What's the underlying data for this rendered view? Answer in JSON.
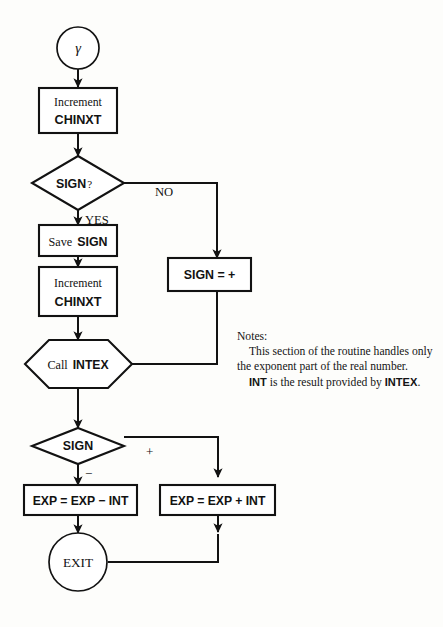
{
  "diagram": {
    "colors": {
      "ink": "#121212",
      "paper": "#fdfdfb",
      "shape_fill": "#ffffff"
    },
    "nodes": {
      "entry": {
        "label": "γ",
        "shape": "circle"
      },
      "increment_1": {
        "line1": "Increment",
        "line2": "CHINXT",
        "shape": "process"
      },
      "sign_question": {
        "label": "SIGN",
        "suffix": "?",
        "shape": "decision"
      },
      "save_sign": {
        "label_a": "Save",
        "label_b": "SIGN",
        "shape": "process"
      },
      "increment_2": {
        "line1": "Increment",
        "line2": "CHINXT",
        "shape": "process"
      },
      "sign_assign": {
        "label": "SIGN = +",
        "shape": "process"
      },
      "call_intex": {
        "label_a": "Call",
        "label_b": "INTEX",
        "shape": "hexagon"
      },
      "sign_test": {
        "label": "SIGN",
        "shape": "decision"
      },
      "exp_minus": {
        "label": "EXP = EXP − INT",
        "shape": "process"
      },
      "exp_plus": {
        "label": "EXP = EXP + INT",
        "shape": "process"
      },
      "exit": {
        "label": "EXIT",
        "shape": "circle"
      }
    },
    "edge_labels": {
      "no": "NO",
      "yes": "YES",
      "plus": "+",
      "minus": "−"
    },
    "notes": {
      "heading": "Notes:",
      "paragraph_1": "This section of the routine handles only the exponent part of the real number.",
      "paragraph_2_bold_lead": "INT",
      "paragraph_2_body": " is the result provided by ",
      "paragraph_2_bold_tail": "INTEX",
      "paragraph_2_end": "."
    }
  }
}
